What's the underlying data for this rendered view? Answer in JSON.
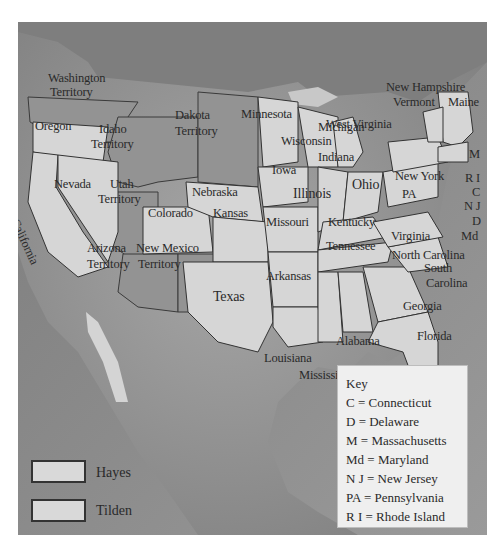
{
  "map": {
    "subject": "Presidential election map (Hayes vs Tilden)",
    "colors": {
      "ocean": "#8a8a8a",
      "land_unorganized": "#9a9a9a",
      "territory": "#8f8f8f",
      "state_fill": "#d6d6d6",
      "border": "#333333",
      "label": "#2a2a2a",
      "key_bg": "#efefef"
    },
    "labels": {
      "washington": "Washington",
      "washington_territory": "Territory",
      "oregon": "Oregon",
      "idaho": "Idaho",
      "idaho_territory": "Territory",
      "california": "California",
      "nevada": "Nevada",
      "utah": "Utah",
      "utah_territory": "Territory",
      "arizona": "Arizona",
      "arizona_territory": "Territory",
      "new_mexico": "New Mexico",
      "new_mexico_territory": "Territory",
      "dakota": "Dakota",
      "dakota_territory": "Territory",
      "nebraska": "Nebraska",
      "colorado": "Colorado",
      "kansas": "Kansas",
      "texas": "Texas",
      "minnesota": "Minnesota",
      "iowa": "Iowa",
      "missouri": "Missouri",
      "arkansas": "Arkansas",
      "louisiana": "Louisiana",
      "wisconsin": "Wisconsin",
      "michigan": "Michigan",
      "illinois": "Illinois",
      "indiana": "Indiana",
      "ohio": "Ohio",
      "kentucky": "Kentucky",
      "tennessee": "Tennessee",
      "mississippi": "Mississippi",
      "alabama": "Alabama",
      "georgia": "Georgia",
      "florida": "Florida",
      "south_carolina_1": "South",
      "south_carolina_2": "Carolina",
      "north_carolina": "North Carolina",
      "virginia": "Virginia",
      "west_virginia": "West Virginia",
      "new_york": "New York",
      "pa": "PA",
      "new_hampshire": "New Hampshire",
      "vermont": "Vermont",
      "maine": "Maine",
      "m": "M",
      "ri": "R I",
      "c": "C",
      "nj": "N J",
      "d": "D",
      "md": "Md"
    }
  },
  "key": {
    "title": "Key",
    "items": [
      "C = Connecticut",
      "D = Delaware",
      "M = Massachusetts",
      "Md = Maryland",
      "N J = New Jersey",
      "PA = Pennsylvania",
      "R I = Rhode Island"
    ]
  },
  "legend": {
    "items": [
      {
        "label": "Hayes",
        "color": "#d9d9d9"
      },
      {
        "label": "Tilden",
        "color": "#d9d9d9"
      }
    ]
  }
}
